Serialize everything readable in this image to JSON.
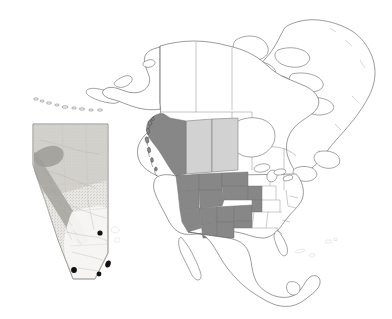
{
  "figure": {
    "kind": "distribution-map",
    "background_color": "#ffffff",
    "width": 392,
    "height": 319
  },
  "colors": {
    "background": "#ffffff",
    "coastline_stroke": "#4a4a4a",
    "border_stroke": "#777777",
    "range_dark": "#878787",
    "range_light": "#d2d2d2",
    "unshaded": "#ffffff",
    "marker_fill": "#111111",
    "inset_frame": "#9a9a9a",
    "inset_land_low": "#f2f0ec",
    "inset_land_mid": "#cfcdc8",
    "inset_land_high": "#a8a6a1",
    "faint_text": "#bdbdbd"
  },
  "main_map": {
    "name": "north-america-base-map",
    "description": "Outline map of North America including Alaska, Canada, Greenland, the continental United States and Mexico",
    "shaded_regions_dark": [
      "British Columbia",
      "Washington",
      "Oregon",
      "Idaho",
      "Montana",
      "Wyoming",
      "Nevada",
      "Utah",
      "Colorado",
      "California",
      "Arizona",
      "New Mexico",
      "Nebraska",
      "Kansas",
      "Oklahoma panhandle"
    ],
    "shaded_regions_light": [
      "Alberta",
      "Saskatchewan"
    ],
    "unshaded_regions": [
      "Alaska",
      "Yukon",
      "Northwest Territories",
      "Nunavut",
      "Manitoba",
      "Ontario",
      "Quebec",
      "Atlantic Canada",
      "Greenland",
      "Midwest United States",
      "Eastern United States",
      "Mexico"
    ]
  },
  "inset_map": {
    "name": "alberta-inset",
    "description": "Shaded relief inset of Alberta, Canada with sampling site markers",
    "frame": {
      "x": 33,
      "y": 124,
      "width": 75,
      "height": 155
    },
    "markers": [
      {
        "label": "site-1",
        "x": 100,
        "y": 233
      },
      {
        "label": "site-2",
        "x": 74,
        "y": 270
      },
      {
        "label": "site-3",
        "x": 108,
        "y": 264
      },
      {
        "label": "site-4",
        "x": 99,
        "y": 274
      }
    ],
    "marker_count": 4
  },
  "annotations": {
    "faint_mark": ""
  }
}
